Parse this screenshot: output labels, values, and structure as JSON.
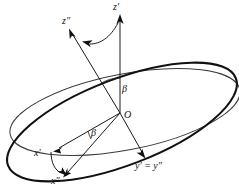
{
  "figure": {
    "background_color": "#ffffff",
    "line_color": "#111111",
    "width": 239,
    "height": 195,
    "labels": {
      "z_prime": "z′",
      "z_double_prime": "z″",
      "x_prime": "x′",
      "x_double_prime": "x″",
      "y_equals": "y′ = y″",
      "origin": "O",
      "beta_upper": "β",
      "beta_lower": "β"
    },
    "elements": {
      "ellipse_horizontal": "thin-ellipse-reference-plane",
      "ellipse_tilted": "thick-ellipse-rotated-plane",
      "axis_z_prime": "vertical-axis",
      "axis_z_double_prime": "tilted-axis",
      "axis_x_prime": "in-plane-axis",
      "axis_x_double_prime": "rotated-in-plane-axis",
      "axis_y": "shared-axis",
      "arc_top": "rotation-arc-z",
      "arc_bottom": "rotation-arc-x"
    }
  }
}
